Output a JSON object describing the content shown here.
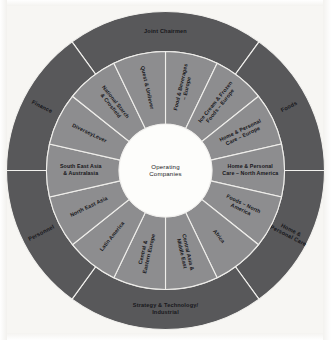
{
  "diagram": {
    "center": {
      "line1": "Operating",
      "line2": "Companies"
    },
    "colors": {
      "outer_ring": "#58585a",
      "inner_ring": "#8d8d8f",
      "hub": "#fdfdfb",
      "divider": "#f0efec",
      "page_background": "#f7f6f3",
      "label_text": "#17171a"
    },
    "outer_ring": {
      "name": "corporate-functions-ring",
      "segment_count": 6,
      "segments": [
        {
          "label": "Joint Chairmen",
          "lines": [
            "Joint Chairmen"
          ],
          "start_angle": -36,
          "end_angle": 36,
          "orientation": "horizontal"
        },
        {
          "label": "Foods",
          "lines": [
            "Foods"
          ],
          "start_angle": 36,
          "end_angle": 90,
          "orientation": "radial"
        },
        {
          "label": "Home & Personal Care",
          "lines": [
            "Home &",
            "Personal Care"
          ],
          "start_angle": 90,
          "end_angle": 144,
          "orientation": "radial"
        },
        {
          "label": "Strategy & Technology/ Industrial",
          "lines": [
            "Strategy & Technology/",
            "Industrial"
          ],
          "start_angle": 144,
          "end_angle": 216,
          "orientation": "horizontal"
        },
        {
          "label": "Personnel",
          "lines": [
            "Personnel"
          ],
          "start_angle": 216,
          "end_angle": 270,
          "orientation": "radial"
        },
        {
          "label": "Finance",
          "lines": [
            "Finance"
          ],
          "start_angle": 270,
          "end_angle": 324,
          "orientation": "radial"
        }
      ]
    },
    "inner_ring": {
      "name": "operating-companies-ring",
      "segment_count": 14,
      "segments": [
        {
          "label": "Food & Beverages – Europe",
          "lines": [
            "Food & Beverages",
            "– Europe"
          ]
        },
        {
          "label": "Ice Cream & Frozen Foods – Europe",
          "lines": [
            "Ice Cream & Frozen",
            "Foods – Europe"
          ]
        },
        {
          "label": "Home & Personal Care – Europe",
          "lines": [
            "Home & Personal",
            "Care – Europe"
          ]
        },
        {
          "label": "Home & Personal Care – North America",
          "lines": [
            "Home & Personal",
            "Care – North America"
          ]
        },
        {
          "label": "Foods – North America",
          "lines": [
            "Foods – North",
            "America"
          ]
        },
        {
          "label": "Africa",
          "lines": [
            "Africa"
          ]
        },
        {
          "label": "Central Asia & Middle East",
          "lines": [
            "Central Asia &",
            "Middle East"
          ]
        },
        {
          "label": "Central & Eastern Europe",
          "lines": [
            "Central &",
            "Eastern Europe"
          ]
        },
        {
          "label": "Latin America",
          "lines": [
            "Latin America"
          ]
        },
        {
          "label": "North East Asia",
          "lines": [
            "North East Asia"
          ]
        },
        {
          "label": "South East Asia & Australasia",
          "lines": [
            "South East Asia",
            "& Australasia"
          ]
        },
        {
          "label": "DiverseyLever",
          "lines": [
            "DiverseyLever"
          ]
        },
        {
          "label": "National Starch & Crosfield",
          "lines": [
            "National Starch",
            "& Crosfield"
          ]
        },
        {
          "label": "Quest & Unilever",
          "lines": [
            "Quest & Unilever"
          ]
        }
      ]
    }
  }
}
